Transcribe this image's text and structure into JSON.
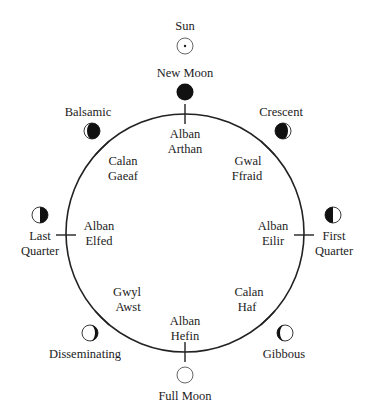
{
  "diagram": {
    "colors": {
      "ink": "#222222",
      "background": "#ffffff"
    },
    "sun": {
      "label": "Sun",
      "icon": "sun-icon"
    },
    "phases": {
      "new_moon": {
        "label": "New Moon",
        "icon": "new-moon-icon"
      },
      "crescent": {
        "label": "Crescent",
        "icon": "crescent-moon-icon"
      },
      "first_quarter": {
        "line1": "First",
        "line2": "Quarter",
        "icon": "first-quarter-moon-icon"
      },
      "gibbous": {
        "label": "Gibbous",
        "icon": "gibbous-moon-icon"
      },
      "full_moon": {
        "label": "Full Moon",
        "icon": "full-moon-icon"
      },
      "disseminating": {
        "label": "Disseminating",
        "icon": "disseminating-moon-icon"
      },
      "last_quarter": {
        "line1": "Last",
        "line2": "Quarter",
        "icon": "last-quarter-moon-icon"
      },
      "balsamic": {
        "label": "Balsamic",
        "icon": "balsamic-moon-icon"
      }
    },
    "festivals": {
      "top": {
        "line1": "Alban",
        "line2": "Arthan"
      },
      "top_right": {
        "line1": "Gwal",
        "line2": "Ffraid"
      },
      "right": {
        "line1": "Alban",
        "line2": "Eilir"
      },
      "bottom_right": {
        "line1": "Calan",
        "line2": "Haf"
      },
      "bottom": {
        "line1": "Alban",
        "line2": "Hefin"
      },
      "bottom_left": {
        "line1": "Gwyl",
        "line2": "Awst"
      },
      "left": {
        "line1": "Alban",
        "line2": "Elfed"
      },
      "top_left": {
        "line1": "Calan",
        "line2": "Gaeaf"
      }
    }
  }
}
